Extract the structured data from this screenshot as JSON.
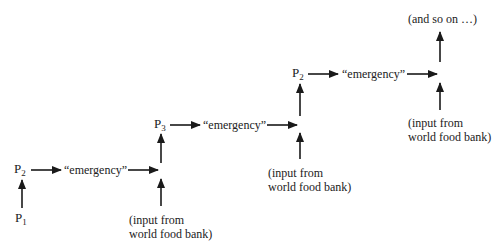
{
  "diagram": {
    "colors": {
      "line": "#1a1a1a",
      "text": "#222222",
      "background": "#ffffff"
    },
    "stages": [
      {
        "p_label": "P",
        "p_sub": "2",
        "emergency": "“emergency”",
        "input_line1": "(input from",
        "input_line2": "world food bank)"
      },
      {
        "p_label": "P",
        "p_sub": "3",
        "emergency": "“emergency”",
        "input_line1": "(input from",
        "input_line2": "world food bank)"
      },
      {
        "p_label": "P",
        "p_sub": "2",
        "emergency": "“emergency”",
        "input_line1": "(input from",
        "input_line2": "world food bank)"
      }
    ],
    "start": {
      "p_label": "P",
      "p_sub": "1"
    },
    "end_label": "(and so on …)"
  }
}
